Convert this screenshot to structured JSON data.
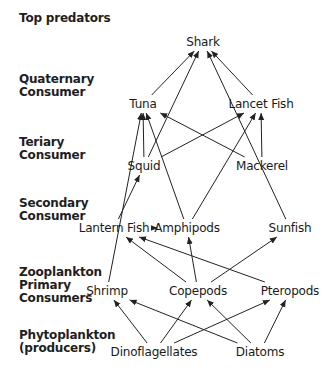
{
  "levels": [
    {
      "id": "top",
      "line1": "Top predators",
      "line2": "",
      "line3": "",
      "y": 18
    },
    {
      "id": "quaternary",
      "line1": "Quaternary",
      "line2": "Consumer",
      "line3": "",
      "y": 79
    },
    {
      "id": "tertiary",
      "line1": "Teriary",
      "line2": "Consumer",
      "line3": "",
      "y": 142
    },
    {
      "id": "secondary",
      "line1": "Secondary",
      "line2": "Consumer",
      "line3": "",
      "y": 203
    },
    {
      "id": "primary",
      "line1": "Zooplankton",
      "line2": "Primary",
      "line3": "Consumers",
      "y": 262
    },
    {
      "id": "producers",
      "line1": "Phytoplankton",
      "line2": "(producers)",
      "line3": "",
      "y": 328
    }
  ],
  "nodes": {
    "shark": {
      "label": "Shark",
      "x": 203,
      "y": 42
    },
    "tuna": {
      "label": "Tuna",
      "x": 143,
      "y": 104
    },
    "lancet_fish": {
      "label": "Lancet Fish",
      "x": 261,
      "y": 104
    },
    "squid": {
      "label": "Squid",
      "x": 144,
      "y": 166
    },
    "mackerel": {
      "label": "Mackerel",
      "x": 262,
      "y": 166
    },
    "lantern_fish": {
      "label": "Lantern Fish",
      "x": 114,
      "y": 228
    },
    "amphipods": {
      "label": "Amphipods",
      "x": 187,
      "y": 228
    },
    "sunfish": {
      "label": "Sunfish",
      "x": 290,
      "y": 228
    },
    "shrimp": {
      "label": "Shrimp",
      "x": 107,
      "y": 291
    },
    "copepods": {
      "label": "Copepods",
      "x": 198,
      "y": 291
    },
    "pteropods": {
      "label": "Pteropods",
      "x": 290,
      "y": 291
    },
    "dinoflagellates": {
      "label": "Dinoflagellates",
      "x": 154,
      "y": 352
    },
    "diatoms": {
      "label": "Diatoms",
      "x": 260,
      "y": 352
    }
  },
  "edges": [
    {
      "from": "tuna",
      "to": "shark"
    },
    {
      "from": "squid",
      "to": "shark"
    },
    {
      "from": "sunfish",
      "to": "shark"
    },
    {
      "from": "lancet_fish",
      "to": "shark"
    },
    {
      "from": "shrimp",
      "to": "tuna"
    },
    {
      "from": "squid",
      "to": "tuna"
    },
    {
      "from": "amphipods",
      "to": "tuna"
    },
    {
      "from": "mackerel",
      "to": "tuna"
    },
    {
      "from": "squid",
      "to": "lancet_fish"
    },
    {
      "from": "amphipods",
      "to": "lancet_fish"
    },
    {
      "from": "mackerel",
      "to": "lancet_fish"
    },
    {
      "from": "lantern_fish",
      "to": "squid"
    },
    {
      "from": "amphipods",
      "to": "lantern_fish"
    },
    {
      "from": "copepods",
      "to": "lantern_fish"
    },
    {
      "from": "pteropods",
      "to": "lantern_fish"
    },
    {
      "from": "copepods",
      "to": "amphipods"
    },
    {
      "from": "copepods",
      "to": "sunfish"
    },
    {
      "from": "dinoflagellates",
      "to": "shrimp"
    },
    {
      "from": "dinoflagellates",
      "to": "copepods"
    },
    {
      "from": "dinoflagellates",
      "to": "pteropods"
    },
    {
      "from": "diatoms",
      "to": "shrimp"
    },
    {
      "from": "diatoms",
      "to": "copepods"
    },
    {
      "from": "diatoms",
      "to": "pteropods"
    }
  ]
}
